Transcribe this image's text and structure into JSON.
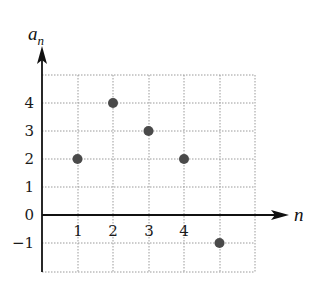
{
  "chart_data": {
    "type": "scatter",
    "title": "",
    "xlabel": "n",
    "ylabel": "a_n",
    "ylabel_main": "a",
    "ylabel_sub": "n",
    "x": [
      1,
      2,
      3,
      4,
      5
    ],
    "y": [
      2,
      4,
      3,
      2,
      -1
    ],
    "series": [
      {
        "name": "a_n",
        "x": [
          1,
          2,
          3,
          4,
          5
        ],
        "values": [
          2,
          4,
          3,
          2,
          -1
        ]
      }
    ],
    "xlim": [
      0,
      6
    ],
    "ylim": [
      -2,
      5
    ],
    "x_ticks": [
      "1",
      "2",
      "3",
      "4"
    ],
    "y_ticks": [
      "4",
      "3",
      "2",
      "1",
      "0",
      "-1"
    ],
    "grid": true,
    "grid_style": "dotted",
    "legend": "none",
    "point_color": "#4a4a4a",
    "axis_color": "#111111",
    "grid_color": "#9a9a9a"
  },
  "ticks": {
    "x": {
      "t1": "1",
      "t2": "2",
      "t3": "3",
      "t4": "4"
    },
    "y": {
      "t4": "4",
      "t3": "3",
      "t2": "2",
      "t1": "1",
      "t0": "0",
      "tm1": "−1"
    }
  },
  "labels": {
    "x": "n",
    "y_main": "a",
    "y_sub": "n"
  }
}
